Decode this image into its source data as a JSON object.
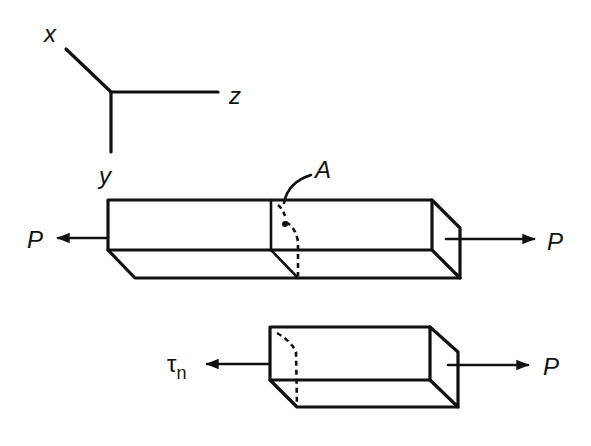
{
  "figure": {
    "axes": {
      "x_label": "x",
      "y_label": "y",
      "z_label": "z"
    },
    "top_bar": {
      "left_force_label": "P",
      "right_force_label": "P",
      "section_label": "A"
    },
    "bottom_bar": {
      "left_stress_label": "τ",
      "left_stress_subscript": "n",
      "right_force_label": "P"
    }
  }
}
